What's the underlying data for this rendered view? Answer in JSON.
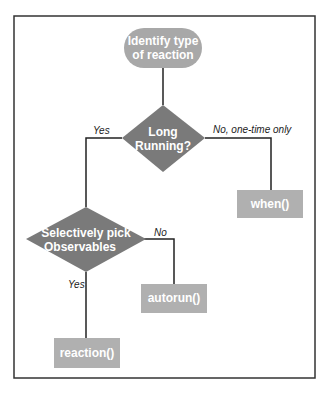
{
  "colors": {
    "start": "#a8a8a8",
    "decision": "#7a7a7a",
    "action": "#b0b0b0",
    "line": "#222222",
    "frame": "#333333"
  },
  "nodes": {
    "start": {
      "line1": "Identify type",
      "line2": "of reaction"
    },
    "decision1": {
      "line1": "Long",
      "line2": "Running?"
    },
    "decision2": {
      "line1": "Selectively pick",
      "line2": "Observables"
    },
    "when": {
      "label": "when()"
    },
    "autorun": {
      "label": "autorun()"
    },
    "reaction": {
      "label": "reaction()"
    }
  },
  "edges": {
    "d1_yes": "Yes",
    "d1_no": "No, one-time only",
    "d2_no": "No",
    "d2_yes": "Yes"
  }
}
